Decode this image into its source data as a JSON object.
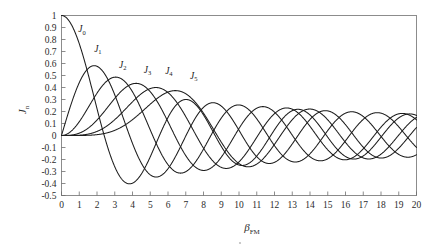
{
  "chart_data": {
    "type": "line",
    "title": "",
    "subtitle": "",
    "xlabel": "β",
    "xlabel_sub": "FM",
    "ylabel": "J",
    "ylabel_sub": "n",
    "xlim": [
      0,
      20
    ],
    "ylim": [
      -0.5,
      1.0
    ],
    "grid": false,
    "legend_position": "inline-labels",
    "xticks": [
      "0",
      "1",
      "2",
      "3",
      "4",
      "5",
      "6",
      "7",
      "8",
      "9",
      "10",
      "11",
      "12",
      "13",
      "14",
      "15",
      "16",
      "17",
      "18",
      "19",
      "20"
    ],
    "xtick_values": [
      0,
      1,
      2,
      3,
      4,
      5,
      6,
      7,
      8,
      9,
      10,
      11,
      12,
      13,
      14,
      15,
      16,
      17,
      18,
      19,
      20
    ],
    "yticks": [
      "1",
      "0.9",
      "0.8",
      "0.7",
      "0.6",
      "0.5",
      "0.4",
      "0.3",
      "0.2",
      "0.1",
      "0",
      "-0.1",
      "-0.2",
      "-0.3",
      "-0.4",
      "-0.5"
    ],
    "ytick_values": [
      1,
      0.9,
      0.8,
      0.7,
      0.6,
      0.5,
      0.4,
      0.3,
      0.2,
      0.1,
      0,
      -0.1,
      -0.2,
      -0.3,
      -0.4,
      -0.5
    ],
    "annotations": [
      {
        "text": "J",
        "sub": "0",
        "x": 1.15,
        "y": 0.86
      },
      {
        "text": "J",
        "sub": "1",
        "x": 2.05,
        "y": 0.7
      },
      {
        "text": "J",
        "sub": "2",
        "x": 3.45,
        "y": 0.565
      },
      {
        "text": "J",
        "sub": "3",
        "x": 4.85,
        "y": 0.525
      },
      {
        "text": "J",
        "sub": "4",
        "x": 6.05,
        "y": 0.515
      },
      {
        "text": "J",
        "sub": "5",
        "x": 7.45,
        "y": 0.475
      }
    ],
    "series": [
      {
        "name": "J0",
        "label": "J₀",
        "order": 0,
        "color": "#1c1c1c",
        "zeros": [
          2.405,
          5.52,
          8.654,
          11.792,
          14.931,
          18.071
        ],
        "extrema": [
          {
            "x": 0.0,
            "y": 1.0
          },
          {
            "x": 3.832,
            "y": -0.4028
          },
          {
            "x": 7.016,
            "y": 0.3001
          },
          {
            "x": 10.174,
            "y": -0.2497
          },
          {
            "x": 13.324,
            "y": 0.2184
          },
          {
            "x": 16.471,
            "y": -0.1965
          },
          {
            "x": 19.616,
            "y": 0.1801
          }
        ]
      },
      {
        "name": "J1",
        "label": "J₁",
        "order": 1,
        "color": "#1c1c1c",
        "zeros": [
          0.0,
          3.832,
          7.016,
          10.174,
          13.324,
          16.471,
          19.616
        ],
        "extrema": [
          {
            "x": 1.841,
            "y": 0.5819
          },
          {
            "x": 5.331,
            "y": -0.3461
          },
          {
            "x": 8.536,
            "y": 0.2731
          },
          {
            "x": 11.706,
            "y": -0.2333
          },
          {
            "x": 14.864,
            "y": 0.2069
          },
          {
            "x": 18.016,
            "y": -0.1877
          }
        ]
      },
      {
        "name": "J2",
        "label": "J₂",
        "order": 2,
        "color": "#1c1c1c",
        "zeros": [
          0.0,
          5.136,
          8.417,
          11.62,
          14.796,
          17.96
        ],
        "extrema": [
          {
            "x": 3.054,
            "y": 0.4865
          },
          {
            "x": 6.706,
            "y": -0.313
          },
          {
            "x": 9.969,
            "y": 0.2547
          },
          {
            "x": 13.17,
            "y": -0.2217
          },
          {
            "x": 16.348,
            "y": 0.199
          },
          {
            "x": 19.513,
            "y": -0.182
          }
        ]
      },
      {
        "name": "J3",
        "label": "J₃",
        "order": 3,
        "color": "#1c1c1c",
        "zeros": [
          0.0,
          6.38,
          9.761,
          13.015,
          16.223,
          19.409
        ],
        "extrema": [
          {
            "x": 4.201,
            "y": 0.4344
          },
          {
            "x": 8.015,
            "y": -0.2911
          },
          {
            "x": 11.346,
            "y": 0.2435
          },
          {
            "x": 14.586,
            "y": -0.2143
          },
          {
            "x": 17.789,
            "y": 0.1935
          }
        ]
      },
      {
        "name": "J4",
        "label": "J₄",
        "order": 4,
        "color": "#1c1c1c",
        "zeros": [
          0.0,
          7.588,
          11.065,
          14.373,
          17.616
        ],
        "extrema": [
          {
            "x": 5.318,
            "y": 0.3991
          },
          {
            "x": 9.282,
            "y": -0.2748
          },
          {
            "x": 12.682,
            "y": 0.2338
          },
          {
            "x": 15.965,
            "y": -0.2077
          },
          {
            "x": 19.196,
            "y": 0.1888
          }
        ]
      },
      {
        "name": "J5",
        "label": "J₅",
        "order": 5,
        "color": "#1c1c1c",
        "zeros": [
          0.0,
          8.771,
          12.339,
          15.7,
          18.98
        ],
        "extrema": [
          {
            "x": 6.415,
            "y": 0.3648
          },
          {
            "x": 10.52,
            "y": -0.2611
          },
          {
            "x": 13.987,
            "y": 0.2255
          },
          {
            "x": 17.313,
            "y": -0.202
          }
        ]
      }
    ]
  }
}
